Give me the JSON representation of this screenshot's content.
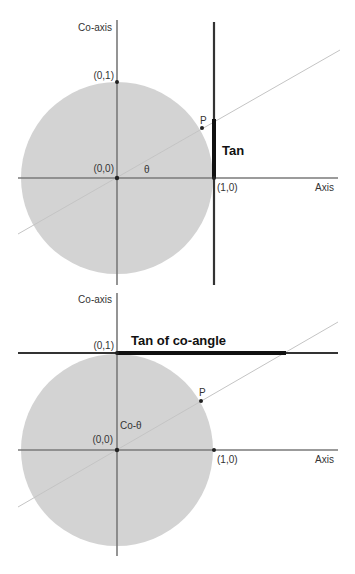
{
  "diagrams": [
    {
      "id": "tangent",
      "labels": {
        "coaxis": "Co-axis",
        "axis": "Axis",
        "point_01": "(0,1)",
        "point_00": "(0,0)",
        "point_10": "(1,0)",
        "point_p": "P",
        "angle": "θ",
        "segment": "Tan"
      }
    },
    {
      "id": "cotangent",
      "labels": {
        "coaxis": "Co-axis",
        "axis": "Axis",
        "point_01": "(0,1)",
        "point_00": "(0,0)",
        "point_10": "(1,0)",
        "point_p": "P",
        "angle": "Co-θ",
        "segment": "Tan of co-angle"
      }
    }
  ],
  "colors": {
    "circle_fill": "#d3d3d3",
    "axis": "#7a7a7a",
    "tangent_line": "#222222",
    "ray": "#c8c8c8"
  }
}
